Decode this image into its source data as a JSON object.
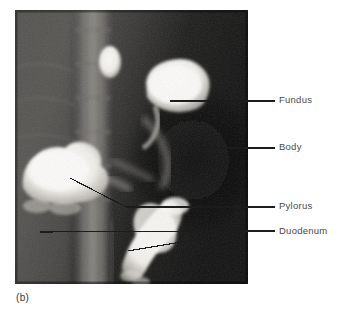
{
  "figure": {
    "caption": "(b)",
    "modality": "barium-contrast-radiograph",
    "panel": {
      "x": 15,
      "y": 10,
      "width": 233,
      "height": 274
    }
  },
  "annotations": [
    {
      "id": "fundus",
      "label": "Fundus",
      "leader": "horizontal"
    },
    {
      "id": "body",
      "label": "Body",
      "leader": "horizontal"
    },
    {
      "id": "pylorus",
      "label": "Pylorus",
      "leader": "polyline"
    },
    {
      "id": "duodenum",
      "label": "Duodenum",
      "leader": "branched"
    }
  ],
  "colors": {
    "background": "#ffffff",
    "label_text": "#4a4a4a",
    "leader_line": "#1c1c1c",
    "caption_text": "#3a3a3a",
    "panel_dark": "#1a1a1a",
    "barium_bright": "#f4f2ee"
  }
}
